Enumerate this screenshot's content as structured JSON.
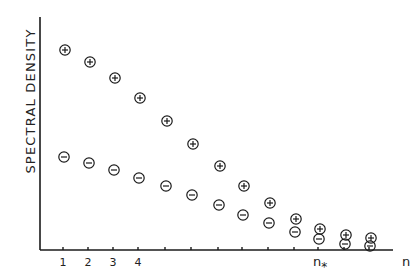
{
  "chart_data": {
    "type": "scatter",
    "title": "",
    "xlabel": "n",
    "ylabel": "SPECTRAL DENSITY",
    "x_tick_labels": [
      "1",
      "2",
      "3",
      "4"
    ],
    "special_x_labels": [
      {
        "label": "n*",
        "x": 11
      },
      {
        "label": "n",
        "x": 14
      }
    ],
    "x": [
      1,
      2,
      3,
      4,
      5,
      6,
      7,
      8,
      9,
      10,
      11,
      12,
      13
    ],
    "series": [
      {
        "name": "+",
        "marker": "circled-plus",
        "values": [
          50,
          62,
          78,
          98,
          121,
          144,
          166,
          186,
          203,
          219,
          229,
          235,
          238
        ]
      },
      {
        "name": "-",
        "marker": "circled-minus",
        "values": [
          157,
          163,
          170,
          178,
          186,
          195,
          205,
          215,
          223,
          232,
          239,
          244,
          246
        ]
      }
    ],
    "y_pixel_note": "values are pixel y positions (axis at 250, lower y = higher density)",
    "grid": false,
    "legend": "none"
  },
  "labels": {
    "ylabel": "SPECTRAL DENSITY",
    "nstar": "n",
    "nstar_sub": "*",
    "n": "n",
    "ticks": [
      "1",
      "2",
      "3",
      "4"
    ]
  }
}
